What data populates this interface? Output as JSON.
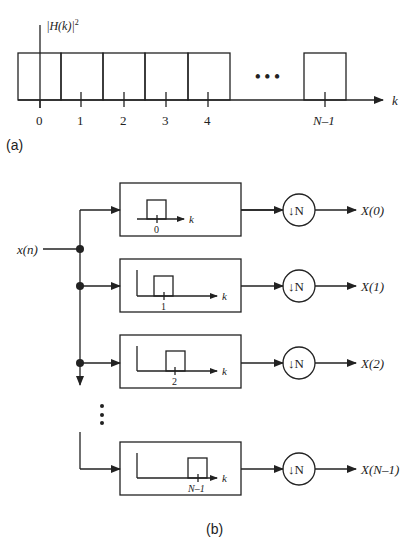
{
  "part_a": {
    "caption": "(a)",
    "y_label_prefix": "|",
    "y_label_H": "H",
    "y_label_k": "(k)|",
    "y_label_sup": "2",
    "x_axis_label": "k",
    "ticks": [
      "0",
      "1",
      "2",
      "3",
      "4",
      "N–1"
    ],
    "ellipsis": "• • •"
  },
  "part_b": {
    "caption": "(b)",
    "input_label": "x(n)",
    "branches": [
      {
        "filter_tick": "0",
        "axis_label": "k",
        "decimator": "↓N",
        "output": "X(0)"
      },
      {
        "filter_tick": "1",
        "axis_label": "k",
        "decimator": "↓N",
        "output": "X(1)"
      },
      {
        "filter_tick": "2",
        "axis_label": "k",
        "decimator": "↓N",
        "output": "X(2)"
      },
      {
        "filter_tick": "N–1",
        "axis_label": "k",
        "decimator": "↓N",
        "output": "X(N–1)"
      }
    ],
    "vertical_ellipsis": "⋮"
  },
  "colors": {
    "stroke": "#222222",
    "background": "#ffffff"
  }
}
